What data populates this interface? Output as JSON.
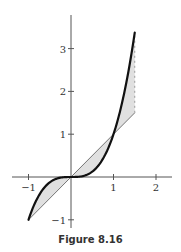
{
  "caption": "Figure 8.16",
  "chart_data": {
    "type": "line",
    "title": "",
    "xlabel": "",
    "ylabel": "",
    "xlim": [
      -1.4,
      2.4
    ],
    "ylim": [
      -1.2,
      3.8
    ],
    "grid": false,
    "legend": null,
    "x_ticks": [
      -1,
      1,
      2
    ],
    "x_tick_labels": [
      "−1",
      "1",
      "2"
    ],
    "y_ticks": [
      -1,
      1,
      2,
      3
    ],
    "y_tick_labels": [
      "−1",
      "1",
      "2",
      "3"
    ],
    "series": [
      {
        "name": "y = x^3",
        "style": "thick black curve",
        "x": [
          -1,
          -0.75,
          -0.5,
          -0.25,
          0,
          0.25,
          0.5,
          0.75,
          1,
          1.25,
          1.5
        ],
        "y": [
          -1,
          -0.42,
          -0.125,
          -0.016,
          0,
          0.016,
          0.125,
          0.42,
          1,
          1.95,
          3.375
        ]
      },
      {
        "name": "y = x",
        "style": "thin line",
        "x": [
          -1,
          1.5
        ],
        "y": [
          -1,
          1.5
        ]
      }
    ],
    "shaded_region": {
      "between": [
        "y = x^3",
        "y = x"
      ],
      "x_range": [
        -1,
        1.5
      ],
      "fill": "#e0e0e0"
    },
    "annotations": [
      {
        "type": "dashed vertical line",
        "x": 1.5,
        "y_from": 1.5,
        "y_to": 3.375
      }
    ]
  },
  "colors": {
    "curve": "#111111",
    "line": "#555555",
    "fill": "#e0e0e0",
    "axis": "#555555"
  }
}
